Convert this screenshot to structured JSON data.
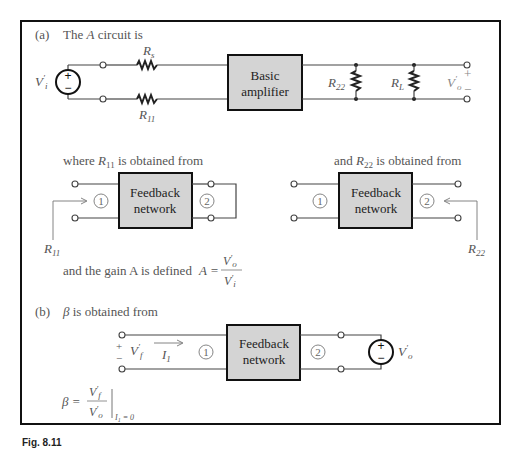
{
  "figure": {
    "caption_partial": "Fig. 8.11",
    "part_a": {
      "label": "(a)",
      "heading": "The A circuit is",
      "source_label": "V'i",
      "source_polarity": [
        "+",
        "−"
      ],
      "series_resistor_top": "Rs",
      "series_resistor_bottom": "R11",
      "block_label": [
        "Basic",
        "amplifier"
      ],
      "shunt_resistors": [
        "R22",
        "RL"
      ],
      "output_label": "V'o",
      "output_polarity": [
        "+",
        "−"
      ],
      "r11_caption": "where R11 is obtained from",
      "r22_caption": "and R22 is obtained from",
      "feedback_block_label": [
        "Feedback",
        "network"
      ],
      "port_labels": [
        "1",
        "2"
      ],
      "r11_arrow_label": "R11",
      "r22_arrow_label": "R22",
      "gain_text": "and the gain A is defined",
      "gain_formula": {
        "lhs": "A =",
        "numerator": "V'o",
        "denominator": "V'i"
      }
    },
    "part_b": {
      "label": "(b)",
      "heading": "β is obtained from",
      "input_voltage": "V'f",
      "input_polarity": [
        "+",
        "−"
      ],
      "current_label": "I1",
      "feedback_block_label": [
        "Feedback",
        "network"
      ],
      "port_labels": [
        "1",
        "2"
      ],
      "source_label": "V'o",
      "source_polarity": [
        "+",
        "−"
      ],
      "beta_formula": {
        "lhs": "β =",
        "numerator": "V'f",
        "denominator": "V'o",
        "condition": "I1 = 0"
      }
    }
  }
}
